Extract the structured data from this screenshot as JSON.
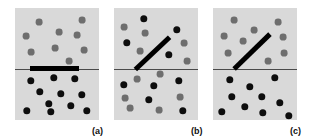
{
  "figure": {
    "background_color": "#ffffff",
    "panel_background_color": "#d9d9d9",
    "dot_dark_color": "#0d0d0d",
    "dot_gray_color": "#6e6e6e",
    "divider_color": "#4a4a4a",
    "bar_color": "#000000",
    "panel_width": 84,
    "panel_height": 112,
    "panel_top": 8
  },
  "chart_data": {
    "type": "scatter",
    "title": "",
    "xlabel": "",
    "ylabel": "",
    "grid": false,
    "legend": "none",
    "panels": [
      {
        "id": "a",
        "label": "(a)",
        "label_x": 92,
        "label_y": 126,
        "origin_x": 15,
        "origin_y": 8,
        "divider": {
          "x1": 0,
          "x2": 84,
          "y": 61
        },
        "bar": {
          "x1": 15,
          "y1": 60,
          "x2": 64,
          "y2": 60,
          "thickness": 5
        },
        "dots": [
          {
            "x": 24,
            "y": 14,
            "r": 3.4,
            "shade": "gray"
          },
          {
            "x": 67,
            "y": 12,
            "r": 3.4,
            "shade": "gray"
          },
          {
            "x": 44,
            "y": 24,
            "r": 3.4,
            "shade": "gray"
          },
          {
            "x": 11,
            "y": 28,
            "r": 3.4,
            "shade": "gray"
          },
          {
            "x": 62,
            "y": 27,
            "r": 3.4,
            "shade": "gray"
          },
          {
            "x": 40,
            "y": 40,
            "r": 3.4,
            "shade": "gray"
          },
          {
            "x": 16,
            "y": 44,
            "r": 3.4,
            "shade": "gray"
          },
          {
            "x": 69,
            "y": 42,
            "r": 3.4,
            "shade": "gray"
          },
          {
            "x": 54,
            "y": 53,
            "r": 3.4,
            "shade": "gray"
          },
          {
            "x": 16,
            "y": 73,
            "r": 3.7,
            "shade": "dark"
          },
          {
            "x": 39,
            "y": 70,
            "r": 3.7,
            "shade": "dark"
          },
          {
            "x": 60,
            "y": 71,
            "r": 3.7,
            "shade": "dark"
          },
          {
            "x": 25,
            "y": 84,
            "r": 3.7,
            "shade": "dark"
          },
          {
            "x": 46,
            "y": 86,
            "r": 3.7,
            "shade": "dark"
          },
          {
            "x": 67,
            "y": 87,
            "r": 3.7,
            "shade": "dark"
          },
          {
            "x": 34,
            "y": 96,
            "r": 3.7,
            "shade": "dark"
          },
          {
            "x": 56,
            "y": 98,
            "r": 3.7,
            "shade": "dark"
          },
          {
            "x": 12,
            "y": 103,
            "r": 3.7,
            "shade": "dark"
          },
          {
            "x": 36,
            "y": 104,
            "r": 3.7,
            "shade": "dark"
          },
          {
            "x": 72,
            "y": 103,
            "r": 3.7,
            "shade": "dark"
          }
        ]
      },
      {
        "id": "b",
        "label": "(b)",
        "label_x": 191,
        "label_y": 126,
        "origin_x": 114,
        "origin_y": 8,
        "divider": {
          "x1": 0,
          "x2": 84,
          "y": 61
        },
        "bar": {
          "x1": 21,
          "y1": 61,
          "x2": 55,
          "y2": 29,
          "thickness": 5
        },
        "dots": [
          {
            "x": 30,
            "y": 11,
            "r": 3.7,
            "shade": "dark"
          },
          {
            "x": 10,
            "y": 19,
            "r": 3.4,
            "shade": "gray"
          },
          {
            "x": 63,
            "y": 22,
            "r": 3.7,
            "shade": "dark"
          },
          {
            "x": 31,
            "y": 25,
            "r": 3.4,
            "shade": "gray"
          },
          {
            "x": 13,
            "y": 35,
            "r": 3.7,
            "shade": "dark"
          },
          {
            "x": 70,
            "y": 35,
            "r": 3.4,
            "shade": "gray"
          },
          {
            "x": 26,
            "y": 43,
            "r": 3.4,
            "shade": "gray"
          },
          {
            "x": 55,
            "y": 47,
            "r": 3.7,
            "shade": "dark"
          },
          {
            "x": 73,
            "y": 53,
            "r": 3.4,
            "shade": "gray"
          },
          {
            "x": 46,
            "y": 66,
            "r": 3.4,
            "shade": "gray"
          },
          {
            "x": 23,
            "y": 71,
            "r": 3.4,
            "shade": "gray"
          },
          {
            "x": 65,
            "y": 73,
            "r": 3.7,
            "shade": "dark"
          },
          {
            "x": 10,
            "y": 77,
            "r": 3.7,
            "shade": "dark"
          },
          {
            "x": 40,
            "y": 78,
            "r": 3.7,
            "shade": "dark"
          },
          {
            "x": 11,
            "y": 90,
            "r": 3.4,
            "shade": "gray"
          },
          {
            "x": 66,
            "y": 89,
            "r": 3.4,
            "shade": "gray"
          },
          {
            "x": 35,
            "y": 92,
            "r": 3.7,
            "shade": "dark"
          },
          {
            "x": 16,
            "y": 100,
            "r": 3.4,
            "shade": "gray"
          },
          {
            "x": 45,
            "y": 102,
            "r": 3.4,
            "shade": "gray"
          },
          {
            "x": 69,
            "y": 103,
            "r": 3.7,
            "shade": "dark"
          }
        ]
      },
      {
        "id": "c",
        "label": "(c)",
        "label_x": 290,
        "label_y": 126,
        "origin_x": 213,
        "origin_y": 8,
        "divider": {
          "x1": 0,
          "x2": 84,
          "y": 61
        },
        "bar": {
          "x1": 21,
          "y1": 61,
          "x2": 57,
          "y2": 26,
          "thickness": 5
        },
        "dots": [
          {
            "x": 21,
            "y": 12,
            "r": 3.4,
            "shade": "gray"
          },
          {
            "x": 65,
            "y": 14,
            "r": 3.4,
            "shade": "gray"
          },
          {
            "x": 41,
            "y": 22,
            "r": 3.4,
            "shade": "gray"
          },
          {
            "x": 11,
            "y": 28,
            "r": 3.4,
            "shade": "gray"
          },
          {
            "x": 70,
            "y": 29,
            "r": 3.4,
            "shade": "gray"
          },
          {
            "x": 30,
            "y": 33,
            "r": 3.4,
            "shade": "gray"
          },
          {
            "x": 15,
            "y": 45,
            "r": 3.4,
            "shade": "gray"
          },
          {
            "x": 71,
            "y": 45,
            "r": 3.4,
            "shade": "gray"
          },
          {
            "x": 55,
            "y": 53,
            "r": 3.4,
            "shade": "gray"
          },
          {
            "x": 17,
            "y": 72,
            "r": 3.7,
            "shade": "dark"
          },
          {
            "x": 62,
            "y": 70,
            "r": 3.7,
            "shade": "dark"
          },
          {
            "x": 37,
            "y": 79,
            "r": 3.7,
            "shade": "dark"
          },
          {
            "x": 19,
            "y": 89,
            "r": 3.7,
            "shade": "dark"
          },
          {
            "x": 49,
            "y": 89,
            "r": 3.7,
            "shade": "dark"
          },
          {
            "x": 67,
            "y": 95,
            "r": 3.7,
            "shade": "dark"
          },
          {
            "x": 32,
            "y": 99,
            "r": 3.7,
            "shade": "dark"
          },
          {
            "x": 9,
            "y": 104,
            "r": 3.7,
            "shade": "dark"
          },
          {
            "x": 50,
            "y": 105,
            "r": 3.7,
            "shade": "dark"
          },
          {
            "x": 76,
            "y": 108,
            "r": 3.7,
            "shade": "dark"
          }
        ]
      }
    ]
  }
}
